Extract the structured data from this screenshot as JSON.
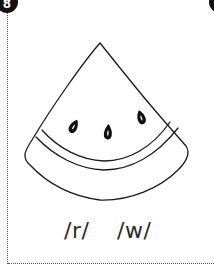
{
  "card": {
    "number_badge": "8",
    "illustration": {
      "subject": "watermelon-slice",
      "seeds": 3,
      "stroke_color": "#1a1a1a",
      "fill_color": "#ffffff"
    },
    "phonemes": [
      {
        "label": "/r/"
      },
      {
        "label": "/w/"
      }
    ],
    "border_style": "dotted",
    "badge_color": "#111111",
    "text_color": "#2a2a2a"
  }
}
